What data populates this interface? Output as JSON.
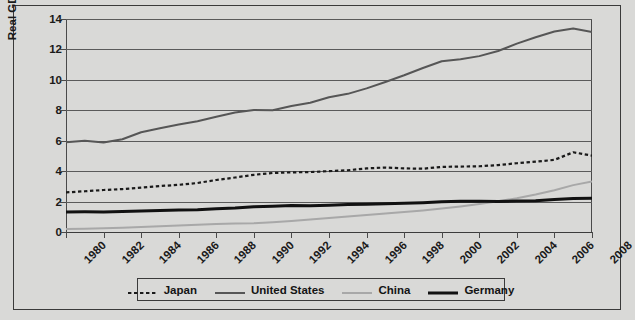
{
  "chart_data": {
    "type": "line",
    "title": "",
    "xlabel": "",
    "ylabel": "Real GDP in Trillions of USD",
    "xlim": [
      1980,
      2008
    ],
    "ylim": [
      0,
      14
    ],
    "ytick_values": [
      0,
      2,
      4,
      6,
      8,
      10,
      12,
      14
    ],
    "ytick_labels": [
      "0",
      "2",
      "4",
      "6",
      "8",
      "10",
      "12",
      "14"
    ],
    "xtick_values": [
      1980,
      1982,
      1984,
      1986,
      1988,
      1990,
      1992,
      1994,
      1996,
      1998,
      2000,
      2002,
      2004,
      2006,
      2008
    ],
    "xtick_labels": [
      "1980",
      "1982",
      "1984",
      "1986",
      "1988",
      "1990",
      "1992",
      "1994",
      "1996",
      "1998",
      "2000",
      "2002",
      "2004",
      "2006",
      "2008"
    ],
    "grid": true,
    "legend_position": "below",
    "x": [
      1980,
      1981,
      1982,
      1983,
      1984,
      1985,
      1986,
      1987,
      1988,
      1989,
      1990,
      1991,
      1992,
      1993,
      1994,
      1995,
      1996,
      1997,
      1998,
      1999,
      2000,
      2001,
      2002,
      2003,
      2004,
      2005,
      2006,
      2007,
      2008
    ],
    "series": [
      {
        "name": "Japan",
        "color": "#1a1a1a",
        "style": "dashed",
        "width": 2.2,
        "values": [
          2.6,
          2.68,
          2.76,
          2.82,
          2.92,
          3.02,
          3.1,
          3.22,
          3.42,
          3.58,
          3.76,
          3.88,
          3.92,
          3.94,
          4.0,
          4.06,
          4.18,
          4.24,
          4.18,
          4.16,
          4.28,
          4.3,
          4.32,
          4.4,
          4.52,
          4.62,
          4.74,
          5.24,
          5.02
        ]
      },
      {
        "name": "United States",
        "color": "#565656",
        "style": "solid",
        "width": 2.0,
        "values": [
          5.9,
          6.0,
          5.88,
          6.1,
          6.56,
          6.82,
          7.06,
          7.28,
          7.58,
          7.86,
          8.02,
          8.0,
          8.28,
          8.5,
          8.86,
          9.08,
          9.44,
          9.86,
          10.3,
          10.78,
          11.22,
          11.36,
          11.56,
          11.9,
          12.38,
          12.8,
          13.18,
          13.38,
          13.14
        ]
      },
      {
        "name": "China",
        "color": "#a8a8a8",
        "style": "solid",
        "width": 2.0,
        "values": [
          0.2,
          0.22,
          0.25,
          0.28,
          0.33,
          0.38,
          0.42,
          0.47,
          0.53,
          0.56,
          0.58,
          0.64,
          0.72,
          0.82,
          0.92,
          1.02,
          1.12,
          1.22,
          1.32,
          1.42,
          1.54,
          1.68,
          1.84,
          2.02,
          2.22,
          2.46,
          2.74,
          3.08,
          3.32
        ]
      },
      {
        "name": "Germany",
        "color": "#111111",
        "style": "solid",
        "width": 3.0,
        "values": [
          1.32,
          1.33,
          1.32,
          1.34,
          1.38,
          1.41,
          1.45,
          1.47,
          1.53,
          1.58,
          1.66,
          1.7,
          1.74,
          1.72,
          1.76,
          1.8,
          1.82,
          1.85,
          1.89,
          1.93,
          1.99,
          2.02,
          2.02,
          2.01,
          2.04,
          2.06,
          2.14,
          2.2,
          2.22
        ]
      }
    ],
    "legend": [
      {
        "label": "Japan",
        "color": "#1a1a1a",
        "style": "dashed",
        "width": 2.2
      },
      {
        "label": "United States",
        "color": "#565656",
        "style": "solid",
        "width": 2.0
      },
      {
        "label": "China",
        "color": "#a8a8a8",
        "style": "solid",
        "width": 2.0
      },
      {
        "label": "Germany",
        "color": "#111111",
        "style": "solid",
        "width": 3.0
      }
    ]
  },
  "colors": {
    "background": "#d9d9d7",
    "border": "#3a3a3a",
    "gridline": "#5a5a5a",
    "axis": "#4a4a4a",
    "text": "#1a1a1a"
  }
}
